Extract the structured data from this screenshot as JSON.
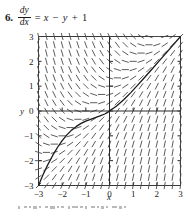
{
  "problem": {
    "number": "6.",
    "derivative_numerator": "dy",
    "derivative_denominator": "dx",
    "equals": "=",
    "rhs_term1": "x",
    "rhs_op1": "−",
    "rhs_term2": "y",
    "rhs_op2": "+",
    "rhs_term3": "1",
    "equation_plain": "dy/dx = x - y + 1"
  },
  "chart_data": {
    "type": "scatter",
    "subtype": "slope-field",
    "title": "",
    "xlabel": "x",
    "ylabel": "y",
    "xlim": [
      -3,
      3
    ],
    "ylim": [
      -3,
      3
    ],
    "xticks": [
      -3,
      -2,
      -1,
      0,
      1,
      2,
      3
    ],
    "yticks": [
      -3,
      -2,
      -1,
      0,
      1,
      2,
      3
    ],
    "xtick_labels": [
      "-3",
      "-2",
      "-1",
      "0",
      "1",
      "2",
      "3"
    ],
    "ytick_labels": [
      "-3",
      "-2",
      "-1",
      "0",
      "1",
      "2",
      "3"
    ],
    "grid": false,
    "axes_through_origin": true,
    "slope_field": {
      "equation": "dy/dx = x - y + 1",
      "grid_columns": 19,
      "grid_rows": 19,
      "x_start": -3,
      "x_end": 3,
      "y_start": -3,
      "y_end": 3,
      "segment_length": 6.5,
      "color": "#4a4a4a"
    },
    "series": [
      {
        "name": "solution curve",
        "type": "line",
        "equation": "y = x - 3 + 3*exp(-(x+3))",
        "color": "#1a1a1a",
        "description": "particular solution through the origin; dips to a minimum near (-1.5, -0.6) and rises asymptotically toward y = x",
        "points": [
          [
            -3.0,
            -3.0
          ],
          [
            -2.8,
            -2.55
          ],
          [
            -2.6,
            -2.15
          ],
          [
            -2.4,
            -1.79
          ],
          [
            -2.2,
            -1.47
          ],
          [
            -2.0,
            -1.19
          ],
          [
            -1.8,
            -0.96
          ],
          [
            -1.6,
            -0.77
          ],
          [
            -1.4,
            -0.62
          ],
          [
            -1.2,
            -0.5
          ],
          [
            -1.0,
            -0.41
          ],
          [
            -0.8,
            -0.34
          ],
          [
            -0.6,
            -0.27
          ],
          [
            -0.4,
            -0.2
          ],
          [
            -0.2,
            -0.12
          ],
          [
            0.0,
            0.0
          ],
          [
            0.3,
            0.2
          ],
          [
            0.6,
            0.45
          ],
          [
            0.9,
            0.74
          ],
          [
            1.2,
            1.05
          ],
          [
            1.5,
            1.37
          ],
          [
            1.8,
            1.69
          ],
          [
            2.1,
            2.02
          ],
          [
            2.4,
            2.34
          ],
          [
            2.7,
            2.67
          ],
          [
            3.0,
            3.0
          ]
        ]
      }
    ],
    "annotations": [
      {
        "name": "asymptote",
        "text": "y = x",
        "visible_as_line": false
      }
    ]
  }
}
